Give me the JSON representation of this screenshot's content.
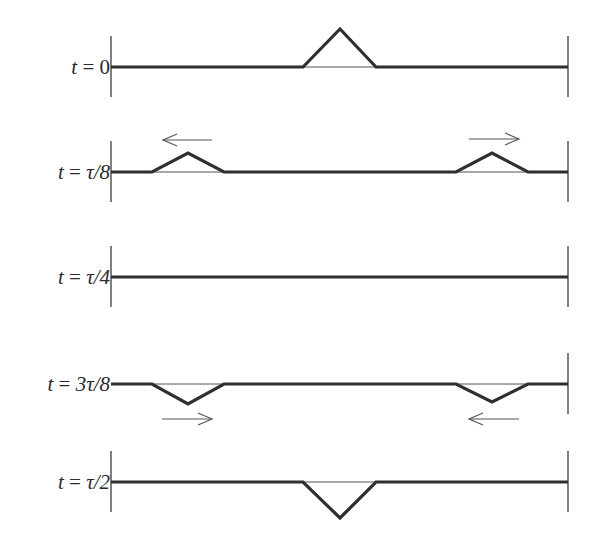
{
  "diagram": {
    "title": "",
    "colors": {
      "string": "#2f2f2f",
      "equilibrium": "#555555",
      "wall": "#4a4a4a",
      "arrow": "#555555",
      "label": "#2a2a2a"
    },
    "geometry": {
      "left_wall_x": 111,
      "right_wall_x": 568
    },
    "rows": [
      {
        "label_var": "t",
        "label_eq": " = ",
        "label_val": "0",
        "baseline_y": 67,
        "left_wall": true,
        "pulses": [
          {
            "x_start": 303,
            "x_peak": 340,
            "x_end": 376,
            "amplitude": -38
          }
        ],
        "arrows": []
      },
      {
        "label_var": "t",
        "label_eq": " = ",
        "label_val": "τ/8",
        "baseline_y": 172,
        "left_wall": true,
        "pulses": [
          {
            "x_start": 152,
            "x_peak": 188,
            "x_end": 224,
            "amplitude": -19
          },
          {
            "x_start": 456,
            "x_peak": 492,
            "x_end": 528,
            "amplitude": -19
          }
        ],
        "arrows": [
          {
            "direction": "left",
            "x1": 163,
            "x2": 212,
            "y": 140
          },
          {
            "direction": "right",
            "x1": 469,
            "x2": 519,
            "y": 139
          }
        ]
      },
      {
        "label_var": "t",
        "label_eq": " = ",
        "label_val": "τ/4",
        "baseline_y": 277,
        "left_wall": true,
        "pulses": [],
        "arrows": []
      },
      {
        "label_var": "t",
        "label_eq": " = ",
        "label_val": "3τ/8",
        "baseline_y": 384,
        "left_wall": false,
        "pulses": [
          {
            "x_start": 152,
            "x_peak": 188,
            "x_end": 224,
            "amplitude": 20
          },
          {
            "x_start": 456,
            "x_peak": 492,
            "x_end": 528,
            "amplitude": 18
          }
        ],
        "arrows": [
          {
            "direction": "right",
            "x1": 162,
            "x2": 212,
            "y": 419
          },
          {
            "direction": "left",
            "x1": 469,
            "x2": 519,
            "y": 419
          }
        ]
      },
      {
        "label_var": "t",
        "label_eq": " = ",
        "label_val": "τ/2",
        "baseline_y": 482,
        "left_wall": true,
        "pulses": [
          {
            "x_start": 303,
            "x_peak": 340,
            "x_end": 376,
            "amplitude": 36
          }
        ],
        "arrows": []
      }
    ]
  }
}
